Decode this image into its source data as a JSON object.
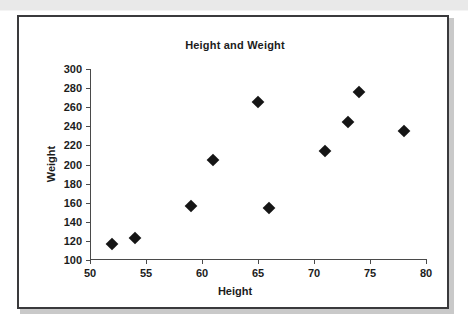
{
  "chart_data": {
    "type": "scatter",
    "title": "Height and Weight",
    "xlabel": "Height",
    "ylabel": "Weight",
    "xlim": [
      50,
      80
    ],
    "ylim": [
      100,
      300
    ],
    "xticks": [
      50,
      55,
      60,
      65,
      70,
      75,
      80
    ],
    "yticks": [
      100,
      120,
      140,
      160,
      180,
      200,
      220,
      240,
      260,
      280,
      300
    ],
    "grid": false,
    "legend": null,
    "marker": "diamond",
    "marker_color": "#151515",
    "points": [
      {
        "x": 52,
        "y": 117
      },
      {
        "x": 54,
        "y": 123
      },
      {
        "x": 59,
        "y": 157
      },
      {
        "x": 61,
        "y": 205
      },
      {
        "x": 65,
        "y": 265
      },
      {
        "x": 66,
        "y": 154
      },
      {
        "x": 71,
        "y": 214
      },
      {
        "x": 73,
        "y": 244
      },
      {
        "x": 74,
        "y": 276
      },
      {
        "x": 78,
        "y": 235
      }
    ]
  },
  "figure": {
    "background": "#ffffff",
    "border_color": "#3a3a3c",
    "page_band_color": "#e9e9e9"
  }
}
